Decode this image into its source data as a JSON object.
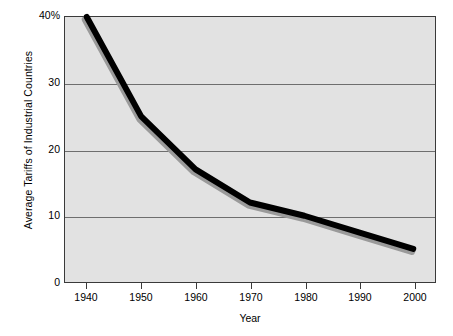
{
  "chart_data": {
    "type": "line",
    "title": "",
    "xlabel": "Year",
    "ylabel": "Average Tariffs of Industrial Countries",
    "x": [
      1940,
      1950,
      1960,
      1970,
      1980,
      1990,
      2000
    ],
    "values": [
      40,
      25,
      17,
      12,
      10,
      7.5,
      5
    ],
    "series": [
      {
        "name": "Average Tariffs of Industrial Countries",
        "values": [
          40,
          25,
          17,
          12,
          10,
          7.5,
          5
        ]
      }
    ],
    "xtick_labels": [
      "1940",
      "1950",
      "1960",
      "1970",
      "1980",
      "1990",
      "2000"
    ],
    "ytick_labels": [
      "40%",
      "30",
      "20",
      "10",
      "0"
    ],
    "ytick_values": [
      40,
      30,
      20,
      10,
      0
    ],
    "xlim": [
      1936,
      2004
    ],
    "ylim": [
      0,
      40
    ],
    "grid": "horizontal",
    "legend": "none",
    "line_color": "#000000",
    "shadow_color": "#9a9a9a",
    "plot_background": "#e2e2e2",
    "axis_color": "#3a3a3a",
    "gridline_color": "#6e6e6e"
  }
}
